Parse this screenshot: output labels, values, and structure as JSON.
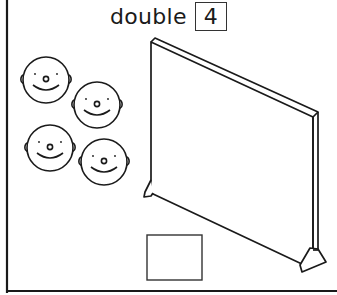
{
  "worksheet": {
    "instruction_word": "double",
    "number": "4",
    "faces_count": 4,
    "answer_box_value": ""
  },
  "colors": {
    "line": "#1a1a1a",
    "background": "#ffffff"
  }
}
